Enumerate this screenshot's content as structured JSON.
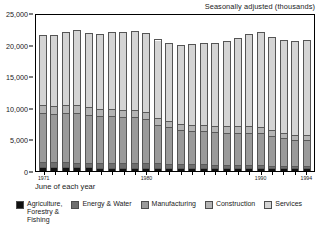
{
  "chart_data": {
    "type": "bar",
    "title": "Seasonally adjusted (thousands)",
    "xlabel": "June of each year",
    "ylabel": "",
    "ylim": [
      0,
      25000
    ],
    "yticks": [
      0,
      5000,
      10000,
      15000,
      20000,
      25000
    ],
    "ytick_labels": [
      "0",
      "5,000",
      "10,000",
      "15,000",
      "20,000",
      "25,000"
    ],
    "grid": false,
    "legend_position": "bottom",
    "stacked": true,
    "categories": [
      "1971",
      "1972",
      "1973",
      "1974",
      "1975",
      "1976",
      "1977",
      "1978",
      "1979",
      "1980",
      "1981",
      "1982",
      "1983",
      "1984",
      "1985",
      "1986",
      "1987",
      "1988",
      "1989",
      "1990",
      "1991",
      "1992",
      "1993",
      "1994"
    ],
    "xtick_labels": [
      "1971",
      "1980",
      "1990",
      "1994"
    ],
    "xtick_label_indices": [
      0,
      9,
      19,
      23
    ],
    "series": [
      {
        "name": "Agriculture, Forestry & Fishing",
        "color": "#111111",
        "values": [
          450,
          440,
          430,
          420,
          410,
          400,
          395,
          390,
          385,
          380,
          370,
          360,
          355,
          350,
          345,
          340,
          330,
          325,
          320,
          315,
          300,
          295,
          290,
          285
        ]
      },
      {
        "name": "Energy & Water",
        "color": "#6e6e6e",
        "values": [
          800,
          790,
          780,
          775,
          770,
          760,
          750,
          740,
          730,
          720,
          690,
          660,
          630,
          600,
          560,
          520,
          480,
          450,
          430,
          410,
          380,
          360,
          330,
          300
        ]
      },
      {
        "name": "Manufacturing",
        "color": "#9a9a9a",
        "values": [
          7800,
          7700,
          7850,
          7900,
          7600,
          7400,
          7400,
          7300,
          7300,
          7000,
          6200,
          5800,
          5400,
          5300,
          5250,
          5200,
          5150,
          5200,
          5200,
          5100,
          4700,
          4400,
          4100,
          4150
        ]
      },
      {
        "name": "Construction",
        "color": "#b4b4b4",
        "values": [
          1250,
          1250,
          1270,
          1270,
          1250,
          1230,
          1200,
          1180,
          1180,
          1180,
          1050,
          1000,
          950,
          950,
          950,
          950,
          1000,
          1050,
          1100,
          1100,
          1000,
          900,
          850,
          800
        ]
      },
      {
        "name": "Services",
        "color": "#d4d4d4",
        "values": [
          11300,
          11300,
          11700,
          11900,
          11800,
          11900,
          12200,
          12400,
          12600,
          12600,
          12500,
          12400,
          12600,
          12900,
          13100,
          13300,
          13600,
          14100,
          14600,
          15000,
          14800,
          14800,
          15000,
          15200
        ]
      }
    ]
  },
  "legend": {
    "items": [
      {
        "label": "Agriculture,\nForestry &\nFishing",
        "color": "#111111"
      },
      {
        "label": "Energy & Water",
        "color": "#6e6e6e"
      },
      {
        "label": "Manufacturing",
        "color": "#9a9a9a"
      },
      {
        "label": "Construction",
        "color": "#b4b4b4"
      },
      {
        "label": "Services",
        "color": "#d4d4d4"
      }
    ]
  }
}
